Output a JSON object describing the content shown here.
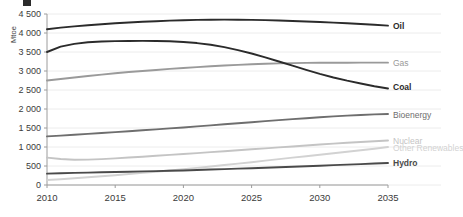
{
  "axes": {
    "y_title": "Mtoe",
    "y_ticks": [
      "4 500",
      "4 000",
      "3 500",
      "3 000",
      "2 500",
      "2 000",
      "1 500",
      "1 000",
      "500",
      "0"
    ],
    "x_ticks": [
      "2010",
      "2015",
      "2020",
      "2025",
      "2030",
      "2035"
    ]
  },
  "legend": [
    {
      "label": "Oil",
      "color": "#2b2b2b"
    },
    {
      "label": "Gas",
      "color": "#9a9a9a"
    },
    {
      "label": "Coal",
      "color": "#2b2b2b"
    },
    {
      "label": "Bioenergy",
      "color": "#6e6e6e"
    },
    {
      "label": "Nuclear",
      "color": "#c4c4c4"
    },
    {
      "label": "Other Renewables",
      "color": "#d2d2d2"
    },
    {
      "label": "Hydro",
      "color": "#4a4a4a"
    }
  ],
  "chart_data": {
    "type": "line",
    "title": "",
    "xlabel": "",
    "ylabel": "Mtoe",
    "xlim": [
      2010,
      2035
    ],
    "ylim": [
      0,
      4500
    ],
    "grid": true,
    "legend_position": "right",
    "x": [
      2010,
      2011,
      2012,
      2013,
      2014,
      2015,
      2016,
      2017,
      2018,
      2019,
      2020,
      2021,
      2022,
      2023,
      2024,
      2025,
      2026,
      2027,
      2028,
      2029,
      2030,
      2031,
      2032,
      2033,
      2034,
      2035
    ],
    "series": [
      {
        "name": "Oil",
        "color": "#2b2b2b",
        "values": [
          4100,
          4140,
          4175,
          4205,
          4230,
          4255,
          4275,
          4295,
          4310,
          4325,
          4335,
          4345,
          4350,
          4352,
          4350,
          4345,
          4338,
          4328,
          4316,
          4302,
          4288,
          4272,
          4256,
          4238,
          4218,
          4195
        ]
      },
      {
        "name": "Gas",
        "color": "#9a9a9a",
        "values": [
          2750,
          2790,
          2830,
          2868,
          2905,
          2940,
          2972,
          3000,
          3028,
          3055,
          3080,
          3103,
          3125,
          3145,
          3162,
          3178,
          3190,
          3200,
          3208,
          3213,
          3216,
          3218,
          3219,
          3220,
          3220,
          3220
        ]
      },
      {
        "name": "Coal",
        "color": "#2b2b2b",
        "values": [
          3500,
          3640,
          3715,
          3755,
          3775,
          3785,
          3790,
          3792,
          3790,
          3782,
          3765,
          3735,
          3690,
          3628,
          3550,
          3460,
          3360,
          3250,
          3140,
          3030,
          2925,
          2830,
          2745,
          2670,
          2600,
          2540
        ]
      },
      {
        "name": "Bioenergy",
        "color": "#6e6e6e",
        "values": [
          1280,
          1300,
          1322,
          1345,
          1368,
          1392,
          1416,
          1440,
          1465,
          1490,
          1515,
          1542,
          1570,
          1598,
          1625,
          1652,
          1680,
          1707,
          1733,
          1758,
          1782,
          1805,
          1825,
          1843,
          1858,
          1870
        ]
      },
      {
        "name": "Nuclear",
        "color": "#c4c4c4",
        "values": [
          720,
          685,
          665,
          668,
          682,
          700,
          722,
          745,
          768,
          792,
          815,
          840,
          865,
          890,
          915,
          940,
          965,
          990,
          1015,
          1040,
          1065,
          1090,
          1112,
          1133,
          1152,
          1170
        ]
      },
      {
        "name": "Other Renewables",
        "color": "#d2d2d2",
        "values": [
          130,
          152,
          176,
          202,
          230,
          258,
          288,
          318,
          350,
          382,
          415,
          450,
          487,
          525,
          562,
          600,
          640,
          680,
          720,
          758,
          795,
          835,
          875,
          915,
          955,
          1000
        ]
      },
      {
        "name": "Hydro",
        "color": "#4a4a4a",
        "values": [
          300,
          310,
          318,
          326,
          334,
          342,
          350,
          358,
          366,
          374,
          383,
          394,
          406,
          418,
          430,
          442,
          455,
          468,
          481,
          494,
          508,
          522,
          536,
          550,
          565,
          580
        ]
      }
    ]
  }
}
